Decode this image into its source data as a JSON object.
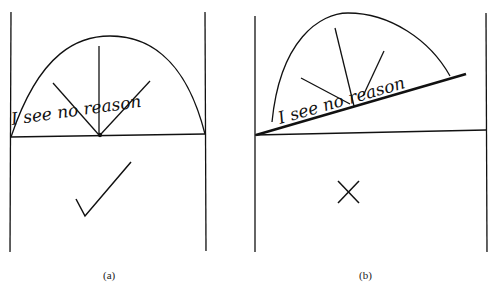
{
  "panels": [
    {
      "label": "(a)",
      "handwriting": "I see no reason",
      "mark": "check",
      "mark_meaning": "correct"
    },
    {
      "label": "(b)",
      "handwriting": "I see no reason",
      "mark": "cross",
      "mark_meaning": "incorrect"
    }
  ],
  "colors": {
    "ink": "#111111",
    "background": "#ffffff"
  }
}
